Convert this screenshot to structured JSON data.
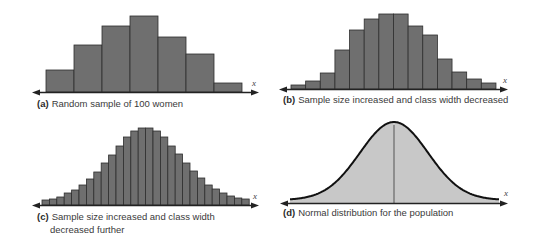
{
  "colors": {
    "bar_fill": "#6f6f6f",
    "bar_stroke": "#2e2e2e",
    "curve_fill": "#c8c8c8",
    "curve_stroke": "#111111",
    "axis": "#222222"
  },
  "panels": [
    {
      "tag": "(a)",
      "caption": "Random sample of 100 women",
      "axis_label": "x"
    },
    {
      "tag": "(b)",
      "caption": "Sample size increased and class width decreased",
      "axis_label": "x"
    },
    {
      "tag": "(c)",
      "caption_line1": "Sample size increased and class width",
      "caption_line2": "decreased further",
      "axis_label": "x"
    },
    {
      "tag": "(d)",
      "caption": "Normal distribution for the population",
      "axis_label": "x"
    }
  ],
  "chart_data": [
    {
      "type": "bar",
      "title": "(a) Random sample of 100 women",
      "xlabel": "x",
      "ylabel": "",
      "grid": false,
      "categories": [
        "1",
        "2",
        "3",
        "4",
        "5",
        "6",
        "7"
      ],
      "values": [
        22,
        47,
        66,
        76,
        55,
        38,
        9
      ],
      "value_units": "relative height (px)"
    },
    {
      "type": "bar",
      "title": "(b) Sample size increased and class width decreased",
      "xlabel": "x",
      "ylabel": "",
      "grid": false,
      "categories": [
        "1",
        "2",
        "3",
        "4",
        "5",
        "6",
        "7",
        "8",
        "9",
        "10",
        "11",
        "12",
        "13",
        "14"
      ],
      "values": [
        4,
        8,
        16,
        39,
        59,
        70,
        75,
        75,
        63,
        54,
        30,
        17,
        10,
        6
      ],
      "value_units": "relative height (px)"
    },
    {
      "type": "bar",
      "title": "(c) Sample size increased and class width decreased further",
      "xlabel": "x",
      "ylabel": "",
      "grid": false,
      "categories": [
        "1",
        "2",
        "3",
        "4",
        "5",
        "6",
        "7",
        "8",
        "9",
        "10",
        "11",
        "12",
        "13",
        "14",
        "15",
        "16",
        "17",
        "18",
        "19",
        "20",
        "21",
        "22",
        "23",
        "24",
        "25",
        "26",
        "27",
        "28"
      ],
      "values": [
        5,
        6,
        8,
        12,
        15,
        20,
        26,
        33,
        42,
        50,
        59,
        68,
        74,
        77,
        77,
        74,
        68,
        59,
        51,
        42,
        34,
        27,
        20,
        16,
        12,
        9,
        7,
        6
      ],
      "value_units": "relative height (px)"
    },
    {
      "type": "area",
      "title": "(d) Normal distribution for the population",
      "xlabel": "x",
      "ylabel": "",
      "grid": false,
      "distribution": "normal",
      "mean_line": true,
      "peak_height": 78,
      "value_units": "relative height (px)"
    }
  ]
}
